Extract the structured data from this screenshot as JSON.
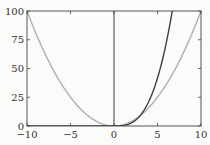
{
  "chart_data": {
    "type": "line",
    "title": "",
    "xlabel": "",
    "ylabel": "",
    "xlim": [
      -10,
      10
    ],
    "ylim": [
      0,
      100
    ],
    "grid": false,
    "legend": null,
    "x_ticks": [
      "-10",
      "-5",
      "0",
      "5",
      "10"
    ],
    "y_ticks": [
      "0",
      "25",
      "50",
      "75",
      "100"
    ],
    "series": [
      {
        "name": "x^2",
        "color": "#aab2ae",
        "x": [
          -10,
          -8,
          -6,
          -4,
          -2,
          0,
          2,
          4,
          6,
          8,
          10
        ],
        "values": [
          100,
          64,
          36,
          16,
          4,
          0,
          4,
          16,
          36,
          64,
          100
        ]
      },
      {
        "name": "ramp-cubic",
        "color": "#354543",
        "x": [
          -10,
          -5,
          0,
          2,
          4,
          5,
          6,
          6.69
        ],
        "values": [
          0,
          0,
          0,
          2.67,
          21.33,
          41.67,
          72,
          100
        ]
      },
      {
        "name": "vertical-line-x0",
        "color": "#354543",
        "x": [
          0,
          0
        ],
        "values": [
          0,
          100
        ]
      }
    ]
  },
  "axes": {
    "x_labels": [
      "−10",
      "−5",
      "0",
      "5",
      "10"
    ],
    "y_labels": [
      "0",
      "25",
      "50",
      "75",
      "100"
    ]
  }
}
